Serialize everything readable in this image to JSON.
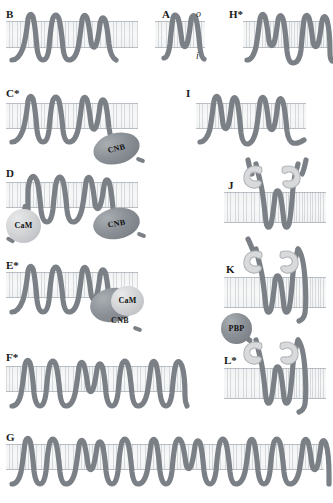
{
  "figure": {
    "panel_count": 12,
    "background_color": "#ffffff",
    "helix_color": "#7b8086",
    "membrane_color": "#f5f6f6",
    "membrane_edge_color": "#b9bfc4",
    "domain_dark_color": "#8d9298",
    "domain_light_color": "#d2d4d6"
  },
  "orientation": {
    "outside_label": "o",
    "inside_label": "i",
    "note": "o marks extracellular/outside face, i marks cytoplasmic/inside face"
  },
  "panels": [
    {
      "id": "A",
      "label": "A",
      "asterisk": false,
      "tm_segments": 2,
      "reentrant_loop": true,
      "domains": [],
      "shows_orientation_labels": true
    },
    {
      "id": "B",
      "label": "B",
      "asterisk": false,
      "tm_segments": 4,
      "reentrant_loop": true,
      "domains": []
    },
    {
      "id": "C",
      "label": "C",
      "asterisk": true,
      "tm_segments": 4,
      "reentrant_loop": true,
      "domains": [
        {
          "name": "CNB",
          "label": "CNB",
          "shape": "ellipse",
          "shade": "dark",
          "side": "inside"
        }
      ]
    },
    {
      "id": "D",
      "label": "D",
      "asterisk": false,
      "tm_segments": 4,
      "reentrant_loop": true,
      "domains": [
        {
          "name": "CaM",
          "label": "CaM",
          "shape": "circle",
          "shade": "light",
          "side": "inside"
        },
        {
          "name": "CNB",
          "label": "CNB",
          "shape": "ellipse",
          "shade": "dark",
          "side": "inside"
        }
      ]
    },
    {
      "id": "E",
      "label": "E",
      "asterisk": true,
      "tm_segments": 4,
      "reentrant_loop": true,
      "domains": [
        {
          "name": "CaM",
          "label": "CaM",
          "shape": "circle",
          "shade": "light",
          "side": "inside"
        },
        {
          "name": "CNB",
          "label": "CNB",
          "shape": "ellipse",
          "shade": "dark",
          "side": "inside"
        }
      ]
    },
    {
      "id": "F",
      "label": "F",
      "asterisk": true,
      "tm_segments": 8,
      "reentrant_loop": true,
      "domains": []
    },
    {
      "id": "G",
      "label": "G",
      "asterisk": false,
      "tm_segments": 16,
      "reentrant_loop": true,
      "domains": []
    },
    {
      "id": "H",
      "label": "H",
      "asterisk": true,
      "tm_segments": 4,
      "reentrant_loop": true,
      "domains": []
    },
    {
      "id": "I",
      "label": "I",
      "asterisk": false,
      "tm_segments": 4,
      "reentrant_loop": true,
      "domains": []
    },
    {
      "id": "J",
      "label": "J",
      "asterisk": false,
      "tm_segments": 2,
      "reentrant_loop": true,
      "domains": [
        {
          "name": "clamp-left",
          "label": "",
          "shape": "clamp",
          "shade": "light",
          "side": "outside"
        },
        {
          "name": "clamp-right",
          "label": "",
          "shape": "clamp",
          "shade": "light",
          "side": "outside"
        }
      ]
    },
    {
      "id": "K",
      "label": "K",
      "asterisk": false,
      "tm_segments": 2,
      "reentrant_loop": true,
      "domains": [
        {
          "name": "clamp-left",
          "label": "",
          "shape": "clamp",
          "shade": "light",
          "side": "outside"
        },
        {
          "name": "clamp-right",
          "label": "",
          "shape": "clamp",
          "shade": "light",
          "side": "outside"
        }
      ]
    },
    {
      "id": "L",
      "label": "L",
      "asterisk": true,
      "tm_segments": 2,
      "reentrant_loop": true,
      "domains": [
        {
          "name": "PBP",
          "label": "PBP",
          "shape": "circle",
          "shade": "dark",
          "side": "outside"
        },
        {
          "name": "clamp-left",
          "label": "",
          "shape": "clamp",
          "shade": "light",
          "side": "outside"
        },
        {
          "name": "clamp-right",
          "label": "",
          "shape": "clamp",
          "shade": "light",
          "side": "outside"
        }
      ]
    }
  ],
  "standalone_labels": {
    "pbp_above_K": "PBP",
    "pbp_in_L": "PBP"
  }
}
